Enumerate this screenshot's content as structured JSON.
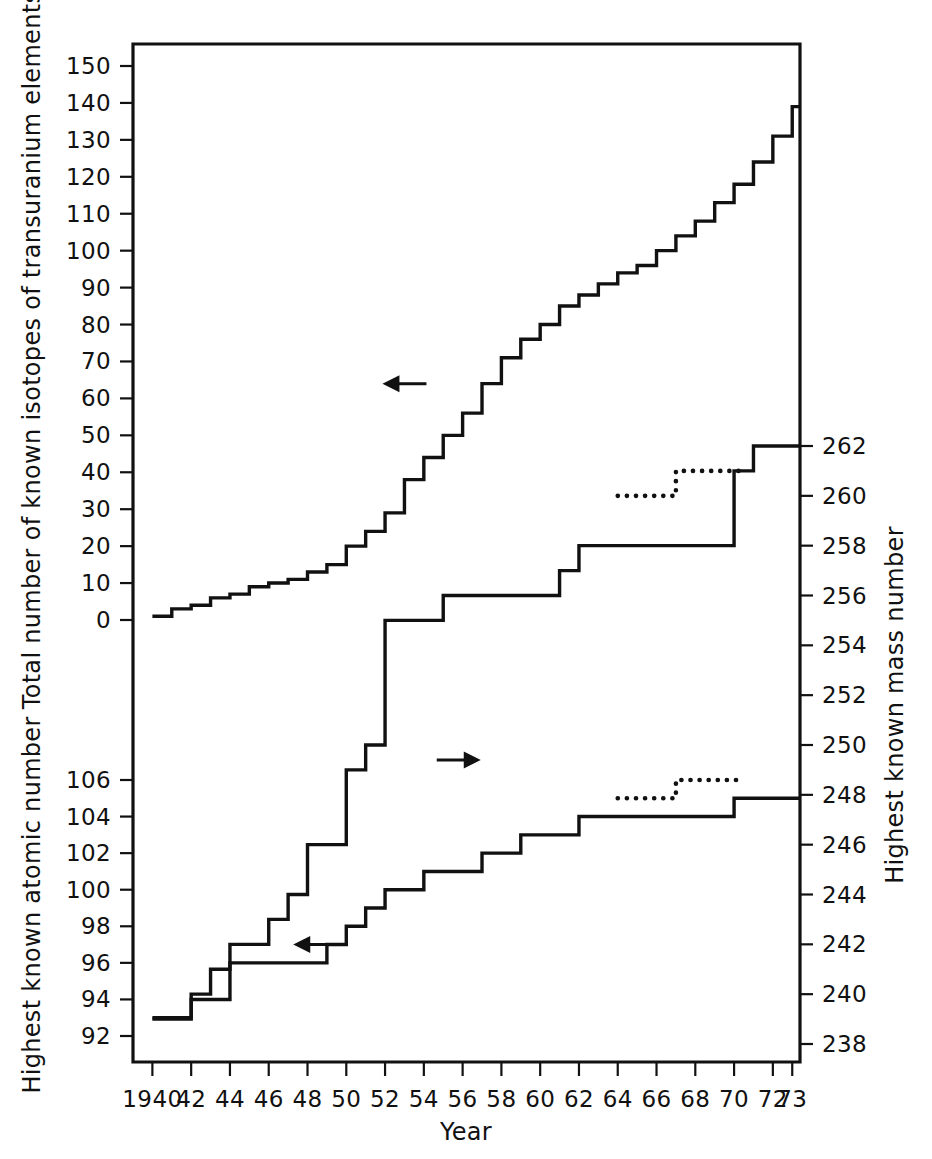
{
  "chart_data": {
    "type": "line",
    "title": "",
    "xlabel": "Year",
    "x_tick_labels": [
      "1940",
      "42",
      "44",
      "46",
      "48",
      "50",
      "52",
      "54",
      "56",
      "58",
      "60",
      "62",
      "64",
      "66",
      "68",
      "70",
      "72",
      "73"
    ],
    "x_tick_values": [
      1940,
      1942,
      1944,
      1946,
      1948,
      1950,
      1952,
      1954,
      1956,
      1958,
      1960,
      1962,
      1964,
      1966,
      1968,
      1970,
      1972,
      1973
    ],
    "xlim": [
      1939.0,
      1973.4
    ],
    "grid": false,
    "legend": "none",
    "axes": [
      {
        "id": "isotopes",
        "side": "left",
        "label": "Total number of known isotopes of transuranium elements",
        "ticks": [
          0,
          10,
          20,
          30,
          40,
          50,
          60,
          70,
          80,
          90,
          100,
          110,
          120,
          130,
          140,
          150
        ],
        "lim": [
          0,
          150
        ]
      },
      {
        "id": "atomic_number",
        "side": "left",
        "label": "Highest known atomic number",
        "ticks": [
          92,
          94,
          96,
          98,
          100,
          102,
          104,
          106
        ],
        "lim": [
          92,
          106
        ]
      },
      {
        "id": "mass_number",
        "side": "right",
        "label": "Highest known mass number",
        "ticks": [
          238,
          240,
          242,
          244,
          246,
          248,
          250,
          252,
          254,
          256,
          258,
          260,
          262
        ],
        "lim": [
          238,
          262
        ]
      }
    ],
    "series": [
      {
        "name": "Total number of known isotopes of transuranium elements",
        "axis": "isotopes",
        "style": "step-solid",
        "arrow": "left",
        "x": [
          1940,
          1941,
          1942,
          1943,
          1944,
          1945,
          1946,
          1947,
          1948,
          1949,
          1950,
          1951,
          1952,
          1953,
          1954,
          1955,
          1956,
          1957,
          1958,
          1959,
          1960,
          1961,
          1962,
          1963,
          1964,
          1965,
          1966,
          1967,
          1968,
          1969,
          1970,
          1971,
          1972,
          1973
        ],
        "values": [
          1,
          3,
          4,
          6,
          7,
          9,
          10,
          11,
          13,
          15,
          20,
          24,
          29,
          38,
          44,
          50,
          56,
          64,
          71,
          76,
          80,
          85,
          88,
          91,
          94,
          96,
          100,
          104,
          108,
          113,
          118,
          124,
          131,
          139
        ]
      },
      {
        "name": "Highest known mass number",
        "axis": "mass_number",
        "style": "step-solid",
        "arrow": "right",
        "x": [
          1940,
          1941,
          1942,
          1943,
          1944,
          1945,
          1946,
          1947,
          1948,
          1949,
          1950,
          1951,
          1952,
          1953,
          1954,
          1955,
          1956,
          1957,
          1958,
          1959,
          1960,
          1961,
          1962,
          1963,
          1964,
          1965,
          1966,
          1967,
          1968,
          1969,
          1970,
          1971,
          1972,
          1973
        ],
        "values": [
          239,
          239,
          240,
          241,
          242,
          242,
          243,
          244,
          246,
          246,
          249,
          250,
          255,
          255,
          255,
          256,
          256,
          256,
          256,
          256,
          256,
          257,
          258,
          258,
          258,
          258,
          258,
          258,
          258,
          258,
          261,
          262,
          262,
          262
        ]
      },
      {
        "name": "Highest known mass number (tentative)",
        "axis": "mass_number",
        "style": "step-dotted",
        "x": [
          1964,
          1965,
          1966,
          1967,
          1968,
          1969,
          1970
        ],
        "values": [
          260,
          260,
          260,
          261,
          261,
          261,
          261
        ]
      },
      {
        "name": "Highest known atomic number",
        "axis": "atomic_number",
        "style": "step-solid",
        "arrow": "left",
        "x": [
          1940,
          1941,
          1942,
          1943,
          1944,
          1945,
          1946,
          1947,
          1948,
          1949,
          1950,
          1951,
          1952,
          1953,
          1954,
          1955,
          1956,
          1957,
          1958,
          1959,
          1960,
          1961,
          1962,
          1963,
          1964,
          1965,
          1966,
          1967,
          1968,
          1969,
          1970,
          1971,
          1972,
          1973
        ],
        "values": [
          93,
          93,
          94,
          94,
          96,
          96,
          96,
          96,
          96,
          97,
          98,
          99,
          100,
          100,
          101,
          101,
          101,
          102,
          102,
          103,
          103,
          103,
          104,
          104,
          104,
          104,
          104,
          104,
          104,
          104,
          105,
          105,
          105,
          105
        ]
      },
      {
        "name": "Highest known atomic number (tentative)",
        "axis": "atomic_number",
        "style": "step-dotted",
        "x": [
          1964,
          1965,
          1966,
          1967,
          1968,
          1969,
          1970
        ],
        "values": [
          105,
          105,
          105,
          106,
          106,
          106,
          106
        ]
      }
    ],
    "annotations": [
      {
        "name": "arrow-isotopes",
        "direction": "left",
        "x": 1953.0,
        "y_axis": "isotopes",
        "y": 64
      },
      {
        "name": "arrow-mass",
        "direction": "right",
        "x": 1955.8,
        "y_axis": "mass_number",
        "y": 249.4
      },
      {
        "name": "arrow-atomic",
        "direction": "left",
        "x": 1948.4,
        "y_axis": "atomic_number",
        "y": 97.0
      }
    ]
  },
  "figure": {
    "xlabel": "Year",
    "left_label_top": "Total number of known isotopes of transuranium elements",
    "left_label_bottom": "Highest known atomic number",
    "right_label": "Highest known mass number"
  }
}
